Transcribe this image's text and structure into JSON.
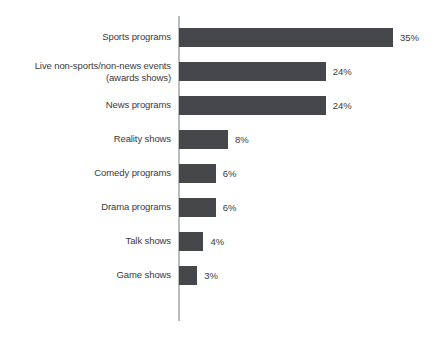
{
  "chart_data": {
    "type": "bar",
    "orientation": "horizontal",
    "title": "",
    "subtitle": "",
    "xlabel": "",
    "ylabel": "",
    "grid": false,
    "legend": false,
    "axis_visible": "category-axis-only",
    "value_suffix": "%",
    "xlim": [
      0,
      35
    ],
    "categories": [
      "Sports programs",
      "Live non-sports/non-news events\n(awards shows)",
      "News programs",
      "Reality shows",
      "Comedy programs",
      "Drama programs",
      "Talk shows",
      "Game shows"
    ],
    "values": [
      35,
      24,
      24,
      8,
      6,
      6,
      4,
      3
    ],
    "value_labels": [
      "35%",
      "24%",
      "24%",
      "8%",
      "6%",
      "6%",
      "4%",
      "3%"
    ],
    "bar_color": "#46474a",
    "axis_color": "#b9bbbd",
    "text_color": "#3a3a3c",
    "background_color": "#ffffff"
  },
  "rows": [
    {
      "label": "Sports programs",
      "value": 35,
      "value_label": "35%",
      "lines": 1
    },
    {
      "label": "Live non-sports/non-news events\n(awards shows)",
      "value": 24,
      "value_label": "24%",
      "lines": 2
    },
    {
      "label": "News programs",
      "value": 24,
      "value_label": "24%",
      "lines": 1
    },
    {
      "label": "Reality shows",
      "value": 8,
      "value_label": "8%",
      "lines": 1
    },
    {
      "label": "Comedy programs",
      "value": 6,
      "value_label": "6%",
      "lines": 1
    },
    {
      "label": "Drama programs",
      "value": 6,
      "value_label": "6%",
      "lines": 1
    },
    {
      "label": "Talk shows",
      "value": 4,
      "value_label": "4%",
      "lines": 1
    },
    {
      "label": "Game shows",
      "value": 3,
      "value_label": "3%",
      "lines": 1
    }
  ]
}
